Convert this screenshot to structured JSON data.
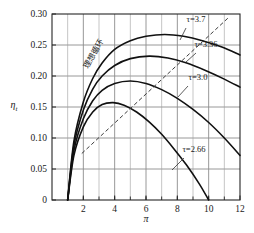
{
  "chart_data": {
    "type": "line",
    "title": "",
    "xlabel": "π",
    "ylabel": "η",
    "ylabel_sub": "t",
    "xlim": [
      0,
      12
    ],
    "ylim": [
      0,
      0.3
    ],
    "grid": true,
    "legend": "inline-labels",
    "x_ticks": [
      2,
      4,
      6,
      8,
      10,
      12
    ],
    "x_tick_labels": [
      "2",
      "4",
      "6",
      "8",
      "10",
      "12"
    ],
    "y_ticks": [
      0,
      0.05,
      0.1,
      0.15,
      0.2,
      0.25,
      0.3
    ],
    "y_tick_labels": [
      "0",
      "0.05",
      "0.10",
      "0.15",
      "0.20",
      "0.25",
      "0.30"
    ],
    "annotations": [
      {
        "name": "ideal-cycle",
        "text": "理想循环",
        "style": "dashed-line-label"
      }
    ],
    "series": [
      {
        "name": "τ=3.7",
        "label": "τ=3.7",
        "style": "solid",
        "peak": {
          "x": 7.2,
          "y": 0.267
        },
        "x": [
          1.0,
          1.4,
          2.0,
          2.6,
          3.2,
          4.0,
          5.0,
          6.0,
          7.2,
          8.4,
          9.6,
          10.8,
          12.0
        ],
        "y": [
          0.0,
          0.095,
          0.158,
          0.196,
          0.221,
          0.243,
          0.257,
          0.264,
          0.267,
          0.264,
          0.257,
          0.247,
          0.234
        ]
      },
      {
        "name": "τ=3.36",
        "label": "τ=3.36",
        "style": "solid",
        "peak": {
          "x": 6.2,
          "y": 0.232
        },
        "x": [
          1.0,
          1.4,
          2.0,
          2.6,
          3.2,
          4.0,
          5.0,
          6.2,
          7.4,
          8.6,
          9.8,
          11.0,
          12.0
        ],
        "y": [
          0.0,
          0.088,
          0.145,
          0.179,
          0.2,
          0.217,
          0.228,
          0.232,
          0.229,
          0.221,
          0.209,
          0.195,
          0.182
        ]
      },
      {
        "name": "τ=3.0",
        "label": "τ=3.0",
        "style": "solid",
        "peak": {
          "x": 5.0,
          "y": 0.192
        },
        "x": [
          1.0,
          1.4,
          2.0,
          2.6,
          3.2,
          4.0,
          5.0,
          6.0,
          7.0,
          8.0,
          9.0,
          10.0,
          11.0,
          12.0
        ],
        "y": [
          0.0,
          0.08,
          0.131,
          0.16,
          0.177,
          0.188,
          0.192,
          0.188,
          0.178,
          0.164,
          0.146,
          0.125,
          0.1,
          0.072
        ]
      },
      {
        "name": "τ=2.66",
        "label": "τ=2.66",
        "style": "solid",
        "peak": {
          "x": 3.9,
          "y": 0.157
        },
        "x": [
          1.0,
          1.4,
          2.0,
          2.6,
          3.2,
          3.9,
          4.6,
          5.4,
          6.2,
          7.0,
          7.8,
          8.6,
          9.4,
          10.0
        ],
        "y": [
          0.0,
          0.072,
          0.118,
          0.142,
          0.154,
          0.157,
          0.153,
          0.142,
          0.126,
          0.106,
          0.082,
          0.056,
          0.026,
          0.0
        ]
      }
    ],
    "ideal_line": {
      "name": "理想循环",
      "style": "dashed",
      "x": [
        1.9,
        11.3
      ],
      "y": [
        0.075,
        0.295
      ]
    }
  }
}
